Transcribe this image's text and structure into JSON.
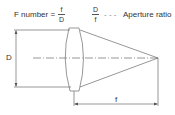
{
  "formula": {
    "f_number_label": "F number =",
    "f_number_numerator": "f",
    "f_number_denominator": "D",
    "ratio_numerator": "D",
    "ratio_denominator": "f",
    "ratio_leader": "- - -",
    "ratio_label": "Aperture ratio"
  },
  "diagram": {
    "diameter_label": "D",
    "focal_length_label": "f",
    "line_color": "#666666",
    "text_color": "#333333"
  }
}
